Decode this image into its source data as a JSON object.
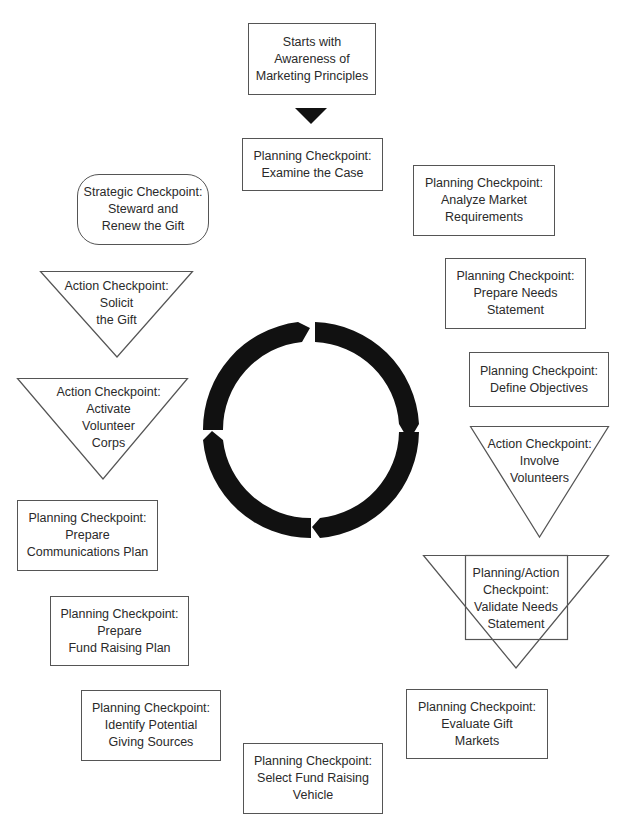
{
  "diagram": {
    "start": {
      "lines": [
        "Starts with",
        "Awareness of",
        "Marketing Principles"
      ]
    },
    "ring": {
      "center": [
        311,
        430
      ],
      "outer_radius": 108,
      "inner_radius": 88,
      "segments": 4,
      "color": "#111111",
      "direction": "clockwise"
    },
    "nodes": [
      {
        "id": "examine-case",
        "shape": "rectangle",
        "lines": [
          "Planning Checkpoint:",
          "Examine the Case"
        ]
      },
      {
        "id": "analyze-market",
        "shape": "rectangle",
        "lines": [
          "Planning Checkpoint:",
          "Analyze Market",
          "Requirements"
        ]
      },
      {
        "id": "prepare-needs",
        "shape": "rectangle",
        "lines": [
          "Planning Checkpoint:",
          "Prepare Needs",
          "Statement"
        ]
      },
      {
        "id": "define-objectives",
        "shape": "rectangle",
        "lines": [
          "Planning Checkpoint:",
          "Define Objectives"
        ]
      },
      {
        "id": "involve-volunteers",
        "shape": "inverted-triangle",
        "lines": [
          "Action Checkpoint:",
          "Involve",
          "Volunteers"
        ]
      },
      {
        "id": "validate-needs",
        "shape": "triangle-with-rectangle",
        "lines": [
          "Planning/Action",
          "Checkpoint:",
          "Validate Needs",
          "Statement"
        ]
      },
      {
        "id": "evaluate-gift",
        "shape": "rectangle",
        "lines": [
          "Planning Checkpoint:",
          "Evaluate Gift",
          "Markets"
        ]
      },
      {
        "id": "select-vehicle",
        "shape": "rectangle",
        "lines": [
          "Planning Checkpoint:",
          "Select Fund Raising",
          "Vehicle"
        ]
      },
      {
        "id": "identify-sources",
        "shape": "rectangle",
        "lines": [
          "Planning Checkpoint:",
          "Identify Potential",
          "Giving Sources"
        ]
      },
      {
        "id": "fund-raising-plan",
        "shape": "rectangle",
        "lines": [
          "Planning Checkpoint:",
          "Prepare",
          "Fund Raising Plan"
        ]
      },
      {
        "id": "communications-plan",
        "shape": "rectangle",
        "lines": [
          "Planning Checkpoint:",
          "Prepare",
          "Communications Plan"
        ]
      },
      {
        "id": "activate-volunteers",
        "shape": "inverted-triangle",
        "lines": [
          "Action Checkpoint:",
          "Activate",
          "Volunteer",
          "Corps"
        ]
      },
      {
        "id": "solicit-gift",
        "shape": "inverted-triangle",
        "lines": [
          "Action Checkpoint:",
          "Solicit",
          "the Gift"
        ]
      },
      {
        "id": "steward-renew",
        "shape": "rounded-rectangle",
        "lines": [
          "Strategic Checkpoint:",
          "Steward and",
          "Renew the Gift"
        ]
      }
    ]
  }
}
